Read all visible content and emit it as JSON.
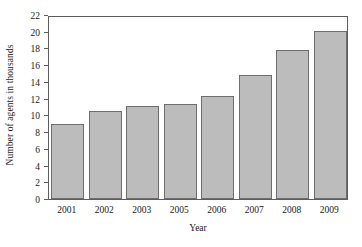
{
  "chart_data": {
    "type": "bar",
    "title": "",
    "xlabel": "Year",
    "ylabel": "Number of agents in thousands",
    "categories": [
      "2001",
      "2002",
      "2003",
      "2005",
      "2006",
      "2007",
      "2008",
      "2009"
    ],
    "values": [
      9.0,
      10.5,
      11.1,
      11.35,
      12.3,
      14.8,
      17.8,
      20.1
    ],
    "ylim": [
      0,
      22
    ],
    "ytick_labels": [
      "0",
      "2",
      "4",
      "6",
      "8",
      "10",
      "12",
      "14",
      "16",
      "18",
      "20",
      "22"
    ],
    "ytick_values": [
      0,
      2,
      4,
      6,
      8,
      10,
      12,
      14,
      16,
      18,
      20,
      22
    ],
    "grid": false,
    "legend": null,
    "bar_color": "#bcbcbc",
    "bar_edge_color": "#6e6e6e",
    "axis_color": "#5d5d5d",
    "background_color": "#ffffff"
  }
}
